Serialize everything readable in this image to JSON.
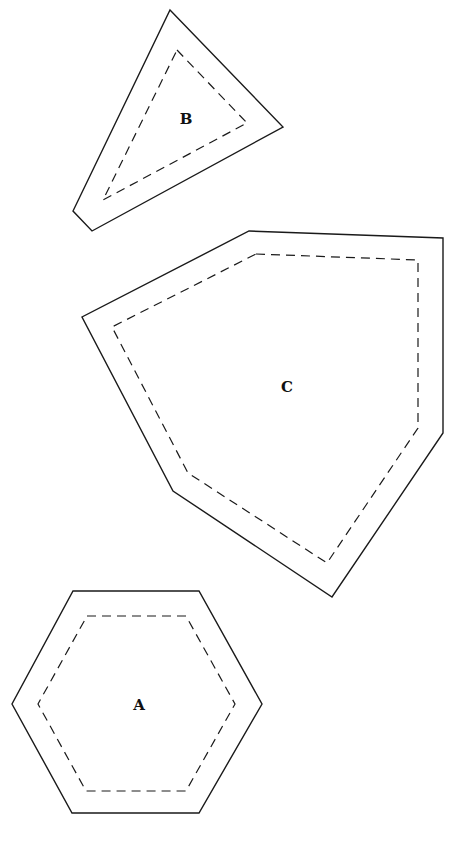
{
  "shapes": [
    {
      "id": "B",
      "label": "B",
      "kind": "triangle",
      "outer_points": "170,10 283,127 92,231 73,211",
      "inner_points": "177,50 247,123 103,200",
      "label_pos": [
        186,
        124
      ]
    },
    {
      "id": "C",
      "label": "C",
      "kind": "pentagon",
      "outer_points": "249,231 443,238 443,433 332,597 173,491 82,317",
      "inner_points": "256,254 418,260 418,428 327,563 188,473 112,327",
      "label_pos": [
        287,
        392
      ]
    },
    {
      "id": "A",
      "label": "A",
      "kind": "hexagon",
      "outer_points": "73,591 199,591 262,704 199,813 72,813 12,704",
      "inner_points": "87,616 186,616 235,704 186,791 86,791 38,704",
      "label_pos": [
        139,
        710
      ]
    }
  ],
  "style": {
    "line_color": "#1a1a1a",
    "background": "#ffffff"
  }
}
